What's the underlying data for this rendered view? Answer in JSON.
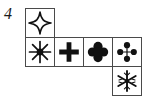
{
  "figure": {
    "label": "4",
    "type": "symbol-grid-puzzle",
    "grid": {
      "rows": 3,
      "cols": 4,
      "cell_size_px": 30,
      "border_color": "#4a4a4a",
      "background_color": "#ffffff",
      "symbol_color": "#111111",
      "shape": "staircase",
      "cells": [
        {
          "row": 0,
          "col": 0,
          "symbol": "four-pointed-star-outline",
          "symbol_char": "✧"
        },
        {
          "row": 1,
          "col": 0,
          "symbol": "eight-pointed-asterisk-filled",
          "symbol_char": "✳"
        },
        {
          "row": 1,
          "col": 1,
          "symbol": "heavy-plus-cross",
          "symbol_char": "✚"
        },
        {
          "row": 1,
          "col": 2,
          "symbol": "four-lobed-clover-filled",
          "symbol_char": "☘"
        },
        {
          "row": 1,
          "col": 3,
          "symbol": "dotted-plus-four-circles",
          "symbol_char": "⁙"
        },
        {
          "row": 2,
          "col": 3,
          "symbol": "six-pointed-snowflake-asterisk",
          "symbol_char": "✵"
        }
      ]
    }
  }
}
